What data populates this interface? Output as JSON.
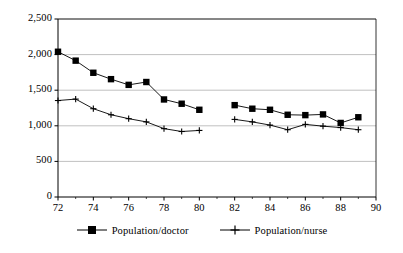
{
  "chart_data": {
    "type": "line",
    "title": "",
    "subtitle": "",
    "xlabel": "",
    "ylabel": "",
    "xlim": [
      72,
      90
    ],
    "ylim": [
      0,
      2500
    ],
    "grid": true,
    "grid_axis": "y",
    "legend_position": "bottom",
    "x_ticks": [
      72,
      74,
      76,
      78,
      80,
      82,
      84,
      86,
      88,
      90
    ],
    "x_tick_labels": [
      "72",
      "74",
      "76",
      "78",
      "80",
      "82",
      "84",
      "86",
      "88",
      "90"
    ],
    "x_minor_ticks": [
      73,
      75,
      77,
      79,
      81,
      83,
      85,
      87,
      89
    ],
    "y_ticks": [
      0,
      500,
      1000,
      1500,
      2000,
      2500
    ],
    "y_tick_labels": [
      "0",
      "500",
      "1,000",
      "1,500",
      "2,000",
      "2,500"
    ],
    "series": [
      {
        "name": "Population/doctor",
        "marker": "filled-square",
        "color": "#000000",
        "x": [
          72,
          73,
          74,
          75,
          76,
          77,
          78,
          79,
          80,
          82,
          83,
          84,
          85,
          86,
          87,
          88,
          89
        ],
        "values": [
          2040,
          1915,
          1745,
          1655,
          1575,
          1615,
          1370,
          1310,
          1225,
          1290,
          1240,
          1225,
          1155,
          1150,
          1160,
          1040,
          1120
        ],
        "gaps": [
          [
            80,
            82
          ]
        ]
      },
      {
        "name": "Population/nurse",
        "marker": "plus",
        "color": "#000000",
        "x": [
          72,
          73,
          74,
          75,
          76,
          77,
          78,
          79,
          80,
          82,
          83,
          84,
          85,
          86,
          87,
          88,
          89
        ],
        "values": [
          1355,
          1375,
          1240,
          1155,
          1100,
          1055,
          960,
          920,
          935,
          1090,
          1055,
          1010,
          945,
          1020,
          995,
          975,
          945
        ],
        "gaps": [
          [
            80,
            82
          ]
        ]
      }
    ]
  },
  "legend": {
    "items": [
      {
        "label": "Population/doctor",
        "marker": "filled-square"
      },
      {
        "label": "Population/nurse",
        "marker": "plus"
      }
    ]
  },
  "axes": {
    "y_labels": [
      "2,500",
      "2,000",
      "1,500",
      "1,000",
      "500",
      "0"
    ],
    "x_labels": [
      "72",
      "74",
      "76",
      "78",
      "80",
      "82",
      "84",
      "86",
      "88",
      "90"
    ]
  },
  "colors": {
    "line": "#000000",
    "gridline": "#b0b0b0",
    "axis": "#000000",
    "background": "#ffffff"
  }
}
